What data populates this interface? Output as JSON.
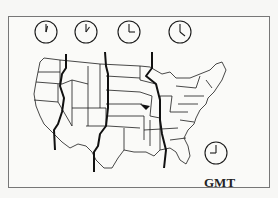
{
  "diagram": {
    "clocks": [
      {
        "zone": "Pacific",
        "hour": 12,
        "minute": 5,
        "cx": 46,
        "cy": 32
      },
      {
        "zone": "Mountain",
        "hour": 1,
        "minute": 0,
        "cx": 86,
        "cy": 32
      },
      {
        "zone": "Central",
        "hour": 3,
        "minute": 0,
        "cx": 129,
        "cy": 32
      },
      {
        "zone": "Eastern",
        "hour": 4,
        "minute": 0,
        "cx": 180,
        "cy": 32
      },
      {
        "zone": "GMT",
        "hour": 9,
        "minute": 0,
        "cx": 216,
        "cy": 153
      }
    ],
    "gmt_label": "GMT",
    "colors": {
      "ink": "#1a1a1a",
      "background": "#fafaf8",
      "frame": "#777777"
    }
  }
}
